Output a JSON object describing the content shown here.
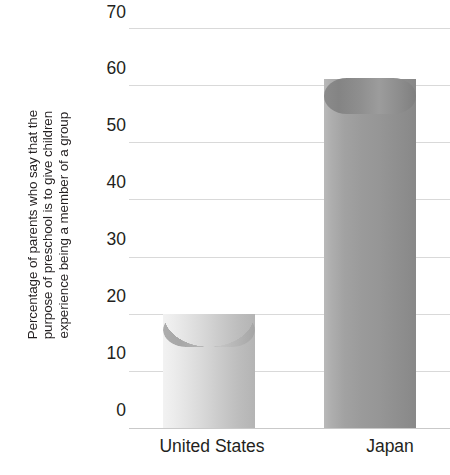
{
  "chart_data": {
    "type": "bar",
    "title": "",
    "subtitle": "",
    "xlabel": "",
    "ylabel": "Percentage of parents who say that the purpose of preschool is to give children experience being a member of a group",
    "ylabel_lines": [
      "Percentage of parents who say that the",
      "purpose of preschool is to give children",
      "experience being a member of a group"
    ],
    "categories": [
      "United States",
      "Japan"
    ],
    "values": [
      20,
      61
    ],
    "ylim": [
      0,
      70
    ],
    "ytick_values": [
      0,
      10,
      20,
      30,
      40,
      50,
      60,
      70
    ],
    "ytick_labels": [
      "0",
      "10",
      "20",
      "30",
      "40",
      "50",
      "60",
      "70"
    ],
    "grid": true,
    "legend": false,
    "legend_position": "none",
    "series": [
      {
        "name": "Percentage of parents",
        "values": [
          20,
          61
        ]
      }
    ],
    "bar_style": "cylinder-3d",
    "colors": {
      "bar_united_states_light": "#f2f2f2",
      "bar_united_states_dark": "#b4b4b4",
      "bar_japan_light": "#b9b9b9",
      "bar_japan_dark": "#888888",
      "gridline": "#d9d9d9",
      "baseline": "#c9c9c9",
      "text": "#231f20",
      "background": "#ffffff"
    }
  },
  "axis": {
    "y_title_line1": "Percentage of parents who say that the",
    "y_title_line2": "purpose of preschool is to give children",
    "y_title_line3": "experience being a member of a group",
    "ticks": [
      "70",
      "60",
      "50",
      "40",
      "30",
      "20",
      "10",
      "0"
    ]
  },
  "categories": {
    "united_states": "United States",
    "japan": "Japan"
  }
}
